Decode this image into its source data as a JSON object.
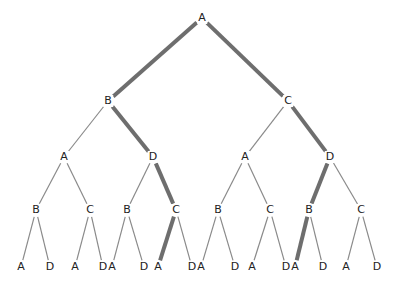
{
  "diagram": {
    "type": "game-tree",
    "colors": {
      "edge": "#8a8a8a",
      "highlight": "#6e6e6e",
      "text": "#222222"
    },
    "nodes": [
      {
        "id": "n0",
        "label": "A",
        "x": 202,
        "y": 18
      },
      {
        "id": "n1",
        "label": "B",
        "x": 108,
        "y": 101
      },
      {
        "id": "n2",
        "label": "C",
        "x": 288,
        "y": 101
      },
      {
        "id": "n3",
        "label": "A",
        "x": 64,
        "y": 157
      },
      {
        "id": "n4",
        "label": "D",
        "x": 153,
        "y": 157
      },
      {
        "id": "n5",
        "label": "A",
        "x": 245,
        "y": 157
      },
      {
        "id": "n6",
        "label": "D",
        "x": 330,
        "y": 157
      },
      {
        "id": "n7",
        "label": "B",
        "x": 36,
        "y": 210
      },
      {
        "id": "n8",
        "label": "C",
        "x": 90,
        "y": 210
      },
      {
        "id": "n9",
        "label": "B",
        "x": 127,
        "y": 210
      },
      {
        "id": "n10",
        "label": "C",
        "x": 176,
        "y": 210
      },
      {
        "id": "n11",
        "label": "B",
        "x": 218,
        "y": 210
      },
      {
        "id": "n12",
        "label": "C",
        "x": 270,
        "y": 210
      },
      {
        "id": "n13",
        "label": "B",
        "x": 309,
        "y": 210
      },
      {
        "id": "n14",
        "label": "C",
        "x": 361,
        "y": 210
      },
      {
        "id": "n15",
        "label": "A",
        "x": 21,
        "y": 267
      },
      {
        "id": "n16",
        "label": "D",
        "x": 50,
        "y": 267
      },
      {
        "id": "n17",
        "label": "A",
        "x": 75,
        "y": 267
      },
      {
        "id": "n18",
        "label": "D",
        "x": 103,
        "y": 267
      },
      {
        "id": "n19",
        "label": "A",
        "x": 112,
        "y": 267
      },
      {
        "id": "n20",
        "label": "D",
        "x": 144,
        "y": 267
      },
      {
        "id": "n21",
        "label": "A",
        "x": 158,
        "y": 267
      },
      {
        "id": "n22",
        "label": "D",
        "x": 192,
        "y": 267
      },
      {
        "id": "n23",
        "label": "A",
        "x": 201,
        "y": 267
      },
      {
        "id": "n24",
        "label": "D",
        "x": 235,
        "y": 267
      },
      {
        "id": "n25",
        "label": "A",
        "x": 252,
        "y": 267
      },
      {
        "id": "n26",
        "label": "D",
        "x": 286,
        "y": 267
      },
      {
        "id": "n27",
        "label": "A",
        "x": 295,
        "y": 267
      },
      {
        "id": "n28",
        "label": "D",
        "x": 323,
        "y": 267
      },
      {
        "id": "n29",
        "label": "A",
        "x": 346,
        "y": 267
      },
      {
        "id": "n30",
        "label": "D",
        "x": 377,
        "y": 267
      }
    ],
    "edges": [
      {
        "from": "n0",
        "to": "n1",
        "highlight": true
      },
      {
        "from": "n0",
        "to": "n2",
        "highlight": true
      },
      {
        "from": "n1",
        "to": "n3",
        "highlight": false
      },
      {
        "from": "n1",
        "to": "n4",
        "highlight": true
      },
      {
        "from": "n2",
        "to": "n5",
        "highlight": false
      },
      {
        "from": "n2",
        "to": "n6",
        "highlight": true
      },
      {
        "from": "n3",
        "to": "n7",
        "highlight": false
      },
      {
        "from": "n3",
        "to": "n8",
        "highlight": false
      },
      {
        "from": "n4",
        "to": "n9",
        "highlight": false
      },
      {
        "from": "n4",
        "to": "n10",
        "highlight": true
      },
      {
        "from": "n5",
        "to": "n11",
        "highlight": false
      },
      {
        "from": "n5",
        "to": "n12",
        "highlight": false
      },
      {
        "from": "n6",
        "to": "n13",
        "highlight": true
      },
      {
        "from": "n6",
        "to": "n14",
        "highlight": false
      },
      {
        "from": "n7",
        "to": "n15",
        "highlight": false
      },
      {
        "from": "n7",
        "to": "n16",
        "highlight": false
      },
      {
        "from": "n8",
        "to": "n17",
        "highlight": false
      },
      {
        "from": "n8",
        "to": "n18",
        "highlight": false
      },
      {
        "from": "n9",
        "to": "n19",
        "highlight": false
      },
      {
        "from": "n9",
        "to": "n20",
        "highlight": false
      },
      {
        "from": "n10",
        "to": "n21",
        "highlight": true
      },
      {
        "from": "n10",
        "to": "n22",
        "highlight": false
      },
      {
        "from": "n11",
        "to": "n23",
        "highlight": false
      },
      {
        "from": "n11",
        "to": "n24",
        "highlight": false
      },
      {
        "from": "n12",
        "to": "n25",
        "highlight": false
      },
      {
        "from": "n12",
        "to": "n26",
        "highlight": false
      },
      {
        "from": "n13",
        "to": "n27",
        "highlight": true
      },
      {
        "from": "n13",
        "to": "n28",
        "highlight": false
      },
      {
        "from": "n14",
        "to": "n29",
        "highlight": false
      },
      {
        "from": "n14",
        "to": "n30",
        "highlight": false
      }
    ]
  }
}
